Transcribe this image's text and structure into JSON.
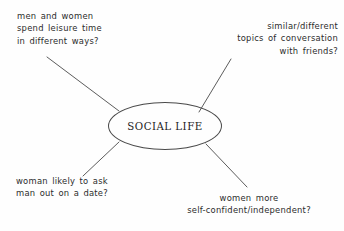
{
  "diagram": {
    "type": "mind-map",
    "topic": "SOCIAL LIFE",
    "center": {
      "label": "SOCIAL LIFE",
      "shape": "ellipse"
    },
    "branches": [
      {
        "id": "leisure",
        "position": "top-left",
        "lines": [
          "men and women",
          "spend leisure time",
          "in different ways?"
        ]
      },
      {
        "id": "topics",
        "position": "top-right",
        "lines": [
          "similar/different",
          "topics of conversation",
          "with friends?"
        ]
      },
      {
        "id": "date",
        "position": "bottom-left",
        "lines": [
          "woman likely to ask",
          "man out on a date?"
        ]
      },
      {
        "id": "confidence",
        "position": "bottom-right",
        "lines": [
          "women more",
          "self-confident/independent?"
        ]
      }
    ],
    "colors": {
      "background": "#fefefe",
      "stroke": "#4a4a4a",
      "text": "#2b2b2b",
      "center_text": "#1d1d1d"
    }
  }
}
